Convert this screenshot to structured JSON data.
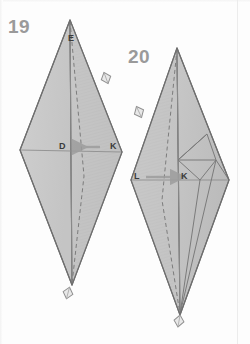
{
  "page": {
    "background_color": "#fdfdfd",
    "margin_rule_color": "#ececec"
  },
  "palette": {
    "paper_fill": "#c9c9c9",
    "paper_fill_light": "#d3d3d3",
    "paper_fill_dark": "#bdbdbd",
    "flap_hatch_fill": "#c2c2c2",
    "outline": "#6e6e6e",
    "crease_line": "#8a8a8a",
    "dashed_crease": "#7c7c7c",
    "arrow_color": "#9d9d9d",
    "step_number_color": "#9a9a9a",
    "label_color": "#3b3b3b",
    "marker_fill": "#e8e8e8",
    "marker_stroke": "#8f8f8f"
  },
  "steps": [
    {
      "id": "step-19",
      "number": "19",
      "number_position": {
        "x": 8,
        "y": 16
      },
      "shape": {
        "name": "kite-rhombus",
        "apex": {
          "x": 70,
          "y": 20
        },
        "left": {
          "x": 20,
          "y": 150
        },
        "bottom": {
          "x": 72,
          "y": 285
        },
        "right": {
          "x": 122,
          "y": 152
        }
      },
      "vertex_labels": [
        {
          "name": "E",
          "text": "E",
          "x": 68,
          "y": 38
        },
        {
          "name": "D",
          "text": "D",
          "x": 60,
          "y": 141
        },
        {
          "name": "K",
          "text": "K",
          "x": 110,
          "y": 141
        }
      ],
      "arrow": {
        "name": "fold-arrow-k-to-d",
        "direction": "left",
        "from_label": "K",
        "to_label": "D",
        "from": {
          "x": 100,
          "y": 147
        },
        "to": {
          "x": 72,
          "y": 147
        }
      },
      "markers": [
        {
          "name": "fold-marker-upper-right",
          "x": 106,
          "y": 78,
          "rotation": -20
        },
        {
          "name": "fold-marker-bottom",
          "x": 68,
          "y": 292,
          "rotation": 15
        }
      ]
    },
    {
      "id": "step-20",
      "number": "20",
      "number_position": {
        "x": 128,
        "y": 46
      },
      "shape": {
        "name": "kite-rhombus",
        "apex": {
          "x": 177,
          "y": 48
        },
        "left": {
          "x": 131,
          "y": 180
        },
        "bottom": {
          "x": 180,
          "y": 315
        },
        "right": {
          "x": 229,
          "y": 180
        }
      },
      "vertex_labels": [
        {
          "name": "L",
          "text": "L",
          "x": 134,
          "y": 172
        },
        {
          "name": "K",
          "text": "K",
          "x": 181,
          "y": 172
        }
      ],
      "arrow": {
        "name": "fold-arrow-l-to-k",
        "direction": "right",
        "from_label": "L",
        "to_label": "K",
        "from": {
          "x": 144,
          "y": 177
        },
        "to": {
          "x": 174,
          "y": 177
        }
      },
      "markers": [
        {
          "name": "fold-marker-upper-left",
          "x": 139,
          "y": 112,
          "rotation": -25
        },
        {
          "name": "fold-marker-bottom",
          "x": 179,
          "y": 320,
          "rotation": 10
        }
      ]
    }
  ],
  "notes": {
    "dashed_lines_meaning": "valley/mountain crease guide",
    "solid_lines_meaning": "paper edge"
  }
}
